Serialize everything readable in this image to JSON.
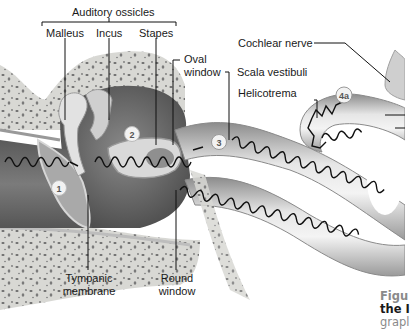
{
  "labels": {
    "auditory_ossicles": "Auditory ossicles",
    "malleus": "Malleus",
    "incus": "Incus",
    "stapes": "Stapes",
    "oval_window_1": "Oval",
    "oval_window_2": "window",
    "scala_vestibuli": "Scala vestibuli",
    "helicotrema": "Helicotrema",
    "cochlear_nerve": "Cochlear nerve",
    "tympanic_membrane_1": "Tympanic",
    "tympanic_membrane_2": "membrane",
    "round_window_1": "Round",
    "round_window_2": "window"
  },
  "steps": {
    "s1": "1",
    "s2": "2",
    "s3": "3",
    "s4a": "4a"
  },
  "caption": {
    "line1": "Figu",
    "line2": "the I",
    "line3": "grapl"
  },
  "colors": {
    "caption_gray": "#8a8a8a",
    "caption_dark": "#1a1a1a",
    "wave": "#111111",
    "bone": "#d9d9d6",
    "cavity": "#6e6e6e"
  }
}
